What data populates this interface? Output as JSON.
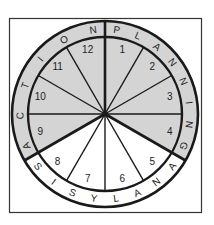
{
  "diagram": {
    "type": "cycle-wheel",
    "colors": {
      "shaded": "#d4d4d4",
      "white": "#ffffff",
      "line": "#1a1a1a"
    },
    "segments": [
      "1",
      "2",
      "3",
      "4",
      "5",
      "6",
      "7",
      "8",
      "9",
      "10",
      "11",
      "12"
    ],
    "phases": [
      {
        "label": "PLANNING",
        "segments": [
          "1",
          "2",
          "3",
          "4"
        ],
        "shaded": true
      },
      {
        "label": "ANALYSIS",
        "segments": [
          "5",
          "6",
          "7",
          "8"
        ],
        "shaded": false
      },
      {
        "label": "ACTION",
        "segments": [
          "9",
          "10",
          "11",
          "12"
        ],
        "shaded": true
      }
    ]
  }
}
